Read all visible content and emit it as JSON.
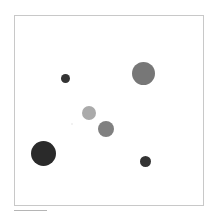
{
  "canvas": {
    "frame": {
      "x": 14,
      "y": 15,
      "width": 188,
      "height": 189,
      "border_color": "#c8c8c8",
      "background": "#ffffff"
    },
    "circles": [
      {
        "id": "c1",
        "cx": 65,
        "cy": 78,
        "r": 4.5,
        "color": "#333333"
      },
      {
        "id": "c2",
        "cx": 143,
        "cy": 73,
        "r": 11.5,
        "color": "#777777"
      },
      {
        "id": "c3",
        "cx": 89,
        "cy": 113,
        "r": 7,
        "color": "#aaaaaa"
      },
      {
        "id": "c4",
        "cx": 106,
        "cy": 129,
        "r": 8,
        "color": "#808080"
      },
      {
        "id": "c5",
        "cx": 43,
        "cy": 153,
        "r": 12.5,
        "color": "#2a2a2a"
      },
      {
        "id": "c6",
        "cx": 145,
        "cy": 161,
        "r": 5.5,
        "color": "#333333"
      },
      {
        "id": "c7",
        "cx": 72,
        "cy": 124,
        "r": 1,
        "color": "#eeeeee"
      }
    ]
  },
  "scrollbar": {
    "x": 14,
    "y": 210,
    "width": 33,
    "color": "#b5b5b5"
  }
}
